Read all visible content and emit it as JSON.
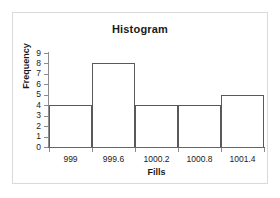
{
  "chart_data": {
    "type": "bar",
    "title": "Histogram",
    "xlabel": "Fills",
    "ylabel": "Frequency",
    "categories": [
      "999",
      "999.6",
      "1000.2",
      "1000.8",
      "1001.4"
    ],
    "values": [
      4,
      8,
      4,
      4,
      5
    ],
    "ylim": [
      0,
      9
    ],
    "ytick_labels": [
      "0",
      "1",
      "2",
      "3",
      "4",
      "5",
      "6",
      "7",
      "8",
      "9"
    ],
    "xtick_labels": [
      "999",
      "999.6",
      "1000.2",
      "1000.8",
      "1001.4"
    ],
    "grid": false,
    "legend": false,
    "bar_outline_color": "#595959",
    "bar_fill_color": "#ffffff",
    "axis_color": "#8c8c8c",
    "frame_color": "#d9d9d9",
    "background_color": "#ffffff",
    "text_color": "#1a1a1a"
  }
}
